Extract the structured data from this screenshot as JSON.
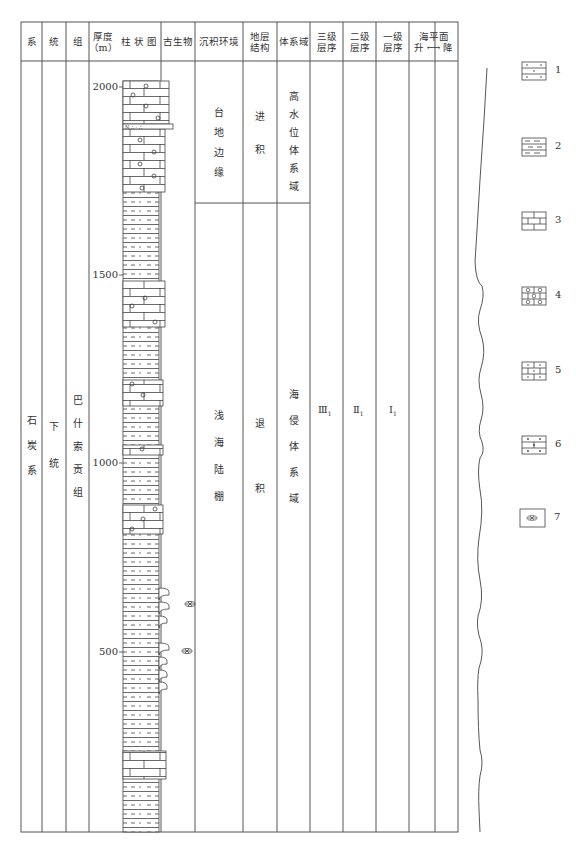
{
  "headers": {
    "system": "系",
    "series": "统",
    "formation": "组",
    "thickness": "厚度",
    "thickness_unit": "（m）",
    "column": "柱 状 图",
    "fossils": "古生物",
    "environment": "沉积环境",
    "structure_l1": "地层",
    "structure_l2": "结构",
    "systems_tract": "体系域",
    "third_order_l1": "三级",
    "third_order_l2": "层序",
    "second_order_l1": "二级",
    "second_order_l2": "层序",
    "first_order_l1": "一级",
    "first_order_l2": "层序",
    "sea_level_l1": "海平面",
    "sea_level_rise": "升",
    "sea_level_arrow": "⟷",
    "sea_level_fall": "降"
  },
  "strata": {
    "system": [
      "石",
      "炭",
      "系"
    ],
    "series": [
      "下",
      "统"
    ],
    "formation": [
      "巴",
      "什",
      "索",
      "贡",
      "组"
    ]
  },
  "depth_ticks": [
    {
      "label": "2000",
      "y": 83
    },
    {
      "label": "1500",
      "y": 275
    },
    {
      "label": "1000",
      "y": 463
    },
    {
      "label": "500",
      "y": 652
    }
  ],
  "upper_unit": {
    "environment": [
      "台",
      "地",
      "边",
      "缘"
    ],
    "structure": [
      "进",
      "积"
    ],
    "systems_tract": [
      "高",
      "水",
      "位",
      "体",
      "系",
      "域"
    ]
  },
  "lower_unit": {
    "environment": [
      "浅",
      "海",
      "陆",
      "棚"
    ],
    "structure": [
      "退",
      "积"
    ],
    "systems_tract": [
      "海",
      "侵",
      "体",
      "系",
      "域"
    ]
  },
  "sequences": {
    "third_order": {
      "roman": "Ⅲ",
      "sub": "1"
    },
    "second_order": {
      "roman": "Ⅱ",
      "sub": "1"
    },
    "first_order": {
      "roman": "Ⅰ",
      "sub": "1"
    }
  },
  "legend": [
    {
      "num": "1",
      "pattern": "arkose-sandstone"
    },
    {
      "num": "2",
      "pattern": "silty-mudstone"
    },
    {
      "num": "3",
      "pattern": "limestone"
    },
    {
      "num": "4",
      "pattern": "oolitic-limestone"
    },
    {
      "num": "5",
      "pattern": "sandy-limestone"
    },
    {
      "num": "6",
      "pattern": "argillaceous-limestone"
    },
    {
      "num": "7",
      "pattern": "brachiopod-fossil"
    }
  ]
}
